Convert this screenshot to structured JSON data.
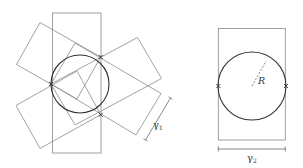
{
  "figure": {
    "left_panel": {
      "description": "Circle with four overlapping rectangles (one vertical, four rotated) touching at three contact points",
      "gamma1_label": "γ",
      "gamma1_subscript": "1",
      "circle": {
        "cx": 80,
        "cy": 84,
        "r": 29
      },
      "contact_points": 3
    },
    "right_panel": {
      "description": "Circle inscribed in a rectangle with radius indicated",
      "radius_label": "R",
      "gamma2_label": "γ",
      "gamma2_subscript": "2",
      "circle": {
        "cx": 252,
        "cy": 86,
        "r": 34
      },
      "contact_points": 2
    }
  },
  "colors": {
    "rect_stroke": "#8a8a8a",
    "circle_stroke": "#333333",
    "background": "#ffffff"
  }
}
